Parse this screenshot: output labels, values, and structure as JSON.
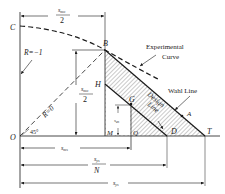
{
  "points": {
    "C": "C",
    "B": "B",
    "H": "H",
    "G": "G",
    "A": "A",
    "O": "O",
    "M": "M",
    "Q": "Q",
    "D": "D",
    "T": "T"
  },
  "labels": {
    "r_neg1": "R=−1",
    "r_zero": "R=0",
    "angle": "45°",
    "experimental_1": "Experimental",
    "experimental_2": "Curve",
    "wahl": "Wahl Line",
    "design_1": "Design",
    "design_2": "Line"
  },
  "dimensions": {
    "top_num": "s",
    "top_num_sub": "mo",
    "top_den": "2",
    "left_num": "s",
    "left_num_sub": "mo",
    "left_den": "2",
    "sas": "s",
    "sas_sub": "as",
    "sms": "s",
    "sms_sub": "ms",
    "sysN_num": "s",
    "sysN_num_sub": "ys",
    "sysN_den": "N",
    "sys": "s",
    "sys_sub": "ys"
  },
  "colors": {
    "ink": "#1a1a1a",
    "hatch": "#555555",
    "background": "#ffffff"
  }
}
